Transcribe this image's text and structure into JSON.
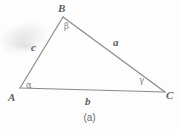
{
  "figure": {
    "caption": "(a)",
    "stroke_color": "#8a8a8a",
    "label_color": "#5f5f5f",
    "background_color": "#fdfdfd"
  },
  "vertices": [
    {
      "name": "B",
      "label": "B",
      "x": 63,
      "y": 17
    },
    {
      "name": "A",
      "label": "A",
      "x": 20,
      "y": 88
    },
    {
      "name": "C",
      "label": "C",
      "x": 165,
      "y": 92
    }
  ],
  "sides": [
    {
      "name": "c",
      "label": "c",
      "between": "A-B"
    },
    {
      "name": "a",
      "label": "a",
      "between": "B-C"
    },
    {
      "name": "b",
      "label": "b",
      "between": "A-C"
    }
  ],
  "angles": [
    {
      "name": "alpha",
      "label": "α",
      "at_vertex": "A"
    },
    {
      "name": "beta",
      "label": "β",
      "at_vertex": "B"
    },
    {
      "name": "gamma",
      "label": "γ",
      "at_vertex": "C"
    }
  ]
}
